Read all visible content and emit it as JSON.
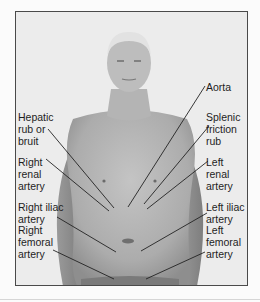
{
  "figure": {
    "labels_left": [
      {
        "id": "hepatic",
        "text": "Hepatic\nrub or\nbruit"
      },
      {
        "id": "right-renal",
        "text": "Right\nrenal\nartery"
      },
      {
        "id": "right-iliac",
        "text": "Right iliac\nartery"
      },
      {
        "id": "right-femoral",
        "text": "Right\nfemoral\nartery"
      }
    ],
    "labels_right": [
      {
        "id": "aorta",
        "text": "Aorta"
      },
      {
        "id": "splenic",
        "text": "Splenic\nfriction\nrub"
      },
      {
        "id": "left-renal",
        "text": "Left\nrenal\nartery"
      },
      {
        "id": "left-iliac",
        "text": "Left iliac\nartery"
      },
      {
        "id": "left-femoral",
        "text": "Left\nfemoral\nartery"
      }
    ]
  },
  "colors": {
    "background": "#ececec",
    "frame_border": "#4a4a4a",
    "skin": "#b8b8b8",
    "leader_line": "#222222",
    "text": "#1e1e1e"
  }
}
